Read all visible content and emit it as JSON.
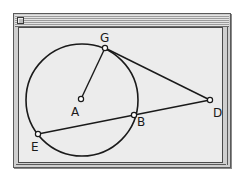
{
  "window": {
    "title": "",
    "close_box": "close-box"
  },
  "diagram": {
    "circle": {
      "center": "A",
      "cx": 68,
      "cy": 86,
      "r": 56
    },
    "points": {
      "A": {
        "label": "A",
        "x": 67,
        "y": 85
      },
      "G": {
        "label": "G",
        "x": 91,
        "y": 34
      },
      "D": {
        "label": "D",
        "x": 196,
        "y": 86
      },
      "B": {
        "label": "B",
        "x": 120,
        "y": 101
      },
      "E": {
        "label": "E",
        "x": 24,
        "y": 120
      }
    },
    "segments": [
      {
        "from": "A",
        "to": "G"
      },
      {
        "from": "G",
        "to": "D"
      },
      {
        "from": "E",
        "to": "D"
      }
    ],
    "labels": {
      "A": "A",
      "G": "G",
      "D": "D",
      "B": "B",
      "E": "E"
    },
    "colors": {
      "stroke": "#1a1a1a",
      "background": "#ececec",
      "point_fill": "#ffffff"
    }
  }
}
